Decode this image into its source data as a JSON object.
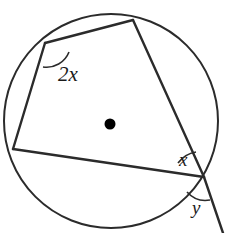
{
  "figure": {
    "kind": "circle-geometry-diagram",
    "width": 227,
    "height": 233,
    "background_color": "#ffffff",
    "stroke_color": "#2b2b2b",
    "label_color": "#1a1a1a"
  },
  "circle": {
    "name": "circumscribed-circle",
    "center_x": 111,
    "center_y": 121,
    "radius": 107,
    "stroke_width": 2
  },
  "center_point": {
    "name": "circle-center-dot",
    "cx": 110,
    "cy": 124,
    "r": 5.5,
    "fill": "#000000"
  },
  "vertices": [
    {
      "id": "A",
      "label": "top-left-vertex",
      "x": 45,
      "y": 43
    },
    {
      "id": "B",
      "label": "top-vertex",
      "x": 133,
      "y": 20
    },
    {
      "id": "C",
      "label": "right-intersection-vertex",
      "x": 204,
      "y": 177
    },
    {
      "id": "D",
      "label": "left-vertex",
      "x": 13,
      "y": 149
    }
  ],
  "chords": [
    {
      "name": "chord-A-B",
      "from": "A",
      "to": "B",
      "x1": 45,
      "y1": 43,
      "x2": 133,
      "y2": 20
    },
    {
      "name": "chord-B-C",
      "from": "B",
      "to": "C",
      "x1": 133,
      "y1": 20,
      "x2": 204,
      "y2": 177
    },
    {
      "name": "chord-D-C",
      "from": "D",
      "to": "C",
      "x1": 13,
      "y1": 149,
      "x2": 204,
      "y2": 177
    },
    {
      "name": "chord-A-D",
      "from": "A",
      "to": "D",
      "x1": 45,
      "y1": 43,
      "x2": 13,
      "y2": 149
    }
  ],
  "secant_extension": {
    "name": "secant-extension-beyond-C",
    "x1": 204,
    "y1": 177,
    "x2": 223,
    "y2": 233
  },
  "angle_marks": [
    {
      "name": "angle-arc-2x",
      "vertex": "A",
      "path": "M 69 52 A 24 24 0 0 1 43 67",
      "stroke_width": 1.6
    },
    {
      "name": "angle-arc-x",
      "vertex": "C",
      "path": "M 178 163 A 28 28 0 0 1 196 152",
      "stroke_width": 1.6
    },
    {
      "name": "angle-arc-y",
      "vertex": "C",
      "path": "M 187 192 A 25 25 0 0 0 210 200",
      "stroke_width": 1.6
    }
  ],
  "labels": {
    "angle_2x": "2x",
    "angle_x": "x",
    "angle_y": "y"
  }
}
